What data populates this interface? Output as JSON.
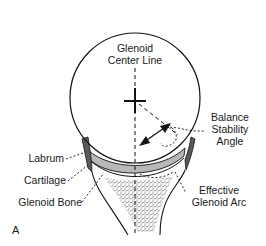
{
  "figure": {
    "panel_letter": "A",
    "labels": {
      "glenoid_center_line": [
        "Glenoid",
        "Center Line"
      ],
      "balance_stability_angle": [
        "Balance",
        "Stability",
        "Angle"
      ],
      "labrum": "Labrum",
      "cartilage": "Cartilage",
      "glenoid_bone": "Glenoid Bone",
      "effective_glenoid_arc": [
        "Effective",
        "Glenoid Arc"
      ]
    },
    "colors": {
      "line": "#111111",
      "labrum_fill": "#5a5a5a",
      "cartilage_fill": "#b8b8b8",
      "bone_stipple": "#444444",
      "background": "#ffffff"
    }
  }
}
